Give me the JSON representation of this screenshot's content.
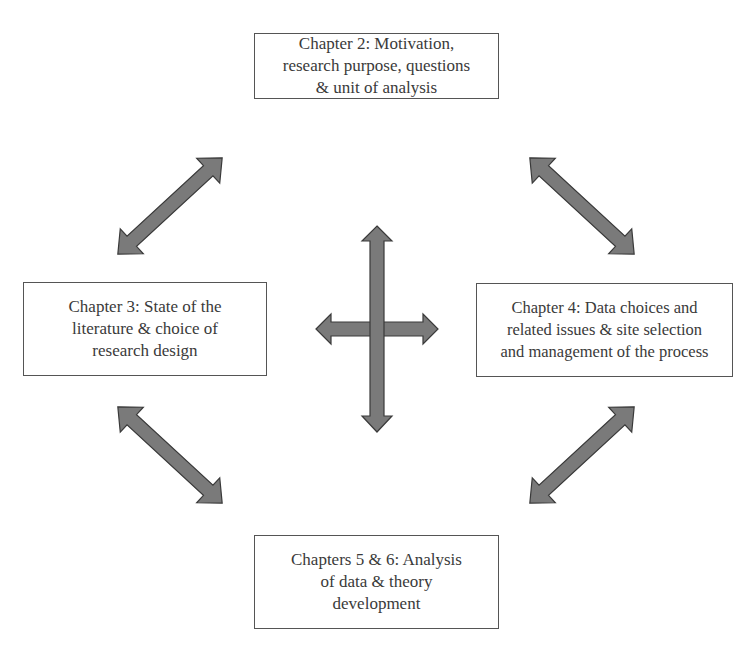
{
  "diagram": {
    "type": "cyclic-process",
    "nodes": {
      "top": {
        "label": "Chapter 2: Motivation,\nresearch purpose, questions\n& unit of analysis"
      },
      "left": {
        "label": "Chapter 3: State of the\nliterature & choice of\nresearch design"
      },
      "right": {
        "label": "Chapter 4: Data choices and\nrelated issues & site selection\nand management of the  process"
      },
      "bottom": {
        "label": "Chapters 5 & 6: Analysis\nof data & theory\ndevelopment"
      }
    },
    "edges": [
      {
        "from": "top",
        "to": "left",
        "style": "double-headed-arrow"
      },
      {
        "from": "top",
        "to": "right",
        "style": "double-headed-arrow"
      },
      {
        "from": "left",
        "to": "bottom",
        "style": "double-headed-arrow"
      },
      {
        "from": "right",
        "to": "bottom",
        "style": "double-headed-arrow"
      }
    ],
    "center": {
      "style": "four-way-cross-arrow",
      "connects": [
        "top",
        "bottom",
        "left",
        "right"
      ]
    },
    "colors": {
      "arrow_fill": "#7a7a7a",
      "arrow_stroke": "#3a3a3a",
      "box_border": "#555555",
      "text": "#3a3a3a",
      "background": "#ffffff"
    }
  }
}
